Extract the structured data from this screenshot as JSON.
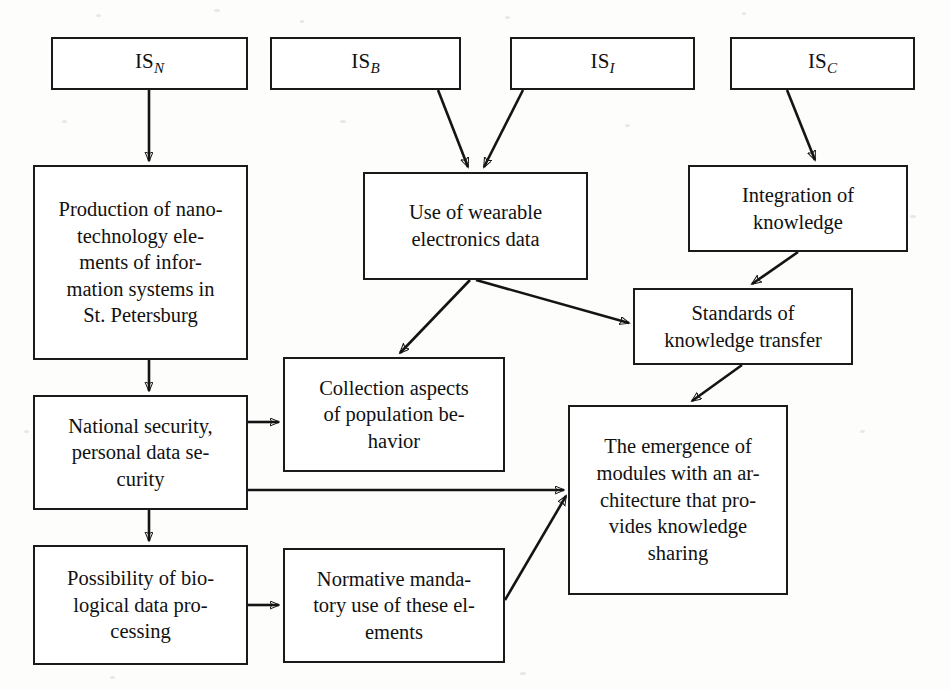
{
  "diagram": {
    "stroke_color": "#141414",
    "box_fill": "#ffffff",
    "background": "#fdfdfc",
    "nodes": [
      {
        "id": "is_n",
        "label": "IS",
        "subscript": "N",
        "kind": "source"
      },
      {
        "id": "is_b",
        "label": "IS",
        "subscript": "B",
        "kind": "source"
      },
      {
        "id": "is_i",
        "label": "IS",
        "subscript": "I",
        "kind": "source"
      },
      {
        "id": "is_c",
        "label": "IS",
        "subscript": "C",
        "kind": "source"
      },
      {
        "id": "production",
        "label": "Production of nano-\ntechnology ele-\nments of infor-\nmation systems in\nSt. Petersburg",
        "kind": "process"
      },
      {
        "id": "national_security",
        "label": "National security,\npersonal data se-\ncurity",
        "kind": "process"
      },
      {
        "id": "biological",
        "label": "Possibility of bio-\nlogical data pro-\ncessing",
        "kind": "process"
      },
      {
        "id": "wearable",
        "label": "Use of wearable\nelectronics data",
        "kind": "process"
      },
      {
        "id": "collection",
        "label": "Collection aspects\nof population be-\nhavior",
        "kind": "process"
      },
      {
        "id": "normative",
        "label": "Normative manda-\ntory use of these el-\nements",
        "kind": "process"
      },
      {
        "id": "integration",
        "label": "Integration of\nknowledge",
        "kind": "process"
      },
      {
        "id": "standards",
        "label": "Standards of\nknowledge transfer",
        "kind": "process"
      },
      {
        "id": "emergence",
        "label": "The emergence of\nmodules with an ar-\nchitecture that pro-\nvides knowledge\nsharing",
        "kind": "process"
      }
    ],
    "edges": [
      {
        "from": "is_n",
        "to": "production"
      },
      {
        "from": "is_b",
        "to": "wearable"
      },
      {
        "from": "is_i",
        "to": "wearable"
      },
      {
        "from": "is_c",
        "to": "integration"
      },
      {
        "from": "production",
        "to": "national_security"
      },
      {
        "from": "national_security",
        "to": "collection"
      },
      {
        "from": "national_security",
        "to": "biological"
      },
      {
        "from": "national_security",
        "to": "emergence"
      },
      {
        "from": "wearable",
        "to": "collection"
      },
      {
        "from": "wearable",
        "to": "standards"
      },
      {
        "from": "integration",
        "to": "standards"
      },
      {
        "from": "standards",
        "to": "emergence"
      },
      {
        "from": "biological",
        "to": "normative"
      },
      {
        "from": "normative",
        "to": "emergence"
      }
    ]
  }
}
